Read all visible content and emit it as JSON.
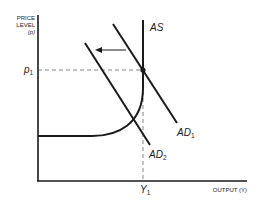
{
  "diagram": {
    "type": "aggregate-supply-aggregate-demand",
    "y_axis": {
      "label_line1": "PRICE",
      "label_line2": "LEVEL",
      "label_line3": "(p)"
    },
    "x_axis": {
      "label": "OUTPUT (Y)"
    },
    "price_marker": {
      "symbol": "p",
      "subscript": "1"
    },
    "output_marker": {
      "symbol": "Y",
      "subscript": "1"
    },
    "curves": {
      "as": {
        "label": "AS"
      },
      "ad1": {
        "symbol": "AD",
        "subscript": "1"
      },
      "ad2": {
        "symbol": "AD",
        "subscript": "2"
      }
    },
    "shift_arrow": {
      "direction": "left",
      "from": "AD1",
      "to": "AD2"
    },
    "colors": {
      "line": "#1a1a1a",
      "dashed": "#555555",
      "background": "#ffffff"
    }
  }
}
